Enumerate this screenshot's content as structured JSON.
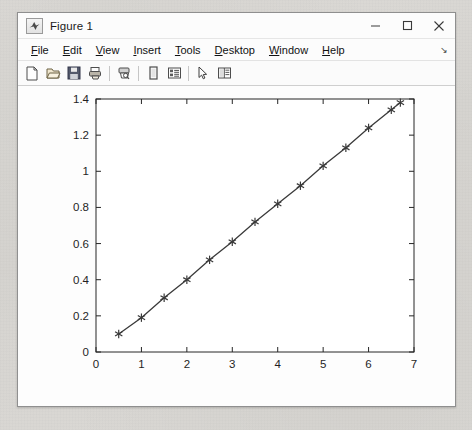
{
  "window": {
    "title": "Figure 1",
    "app_icon": "matlab-icon",
    "controls": [
      {
        "name": "minimize-button",
        "glyph": "minimize-icon"
      },
      {
        "name": "maximize-button",
        "glyph": "maximize-icon"
      },
      {
        "name": "close-button",
        "glyph": "close-icon"
      }
    ]
  },
  "menu": {
    "items": [
      {
        "label": "File",
        "mnemonic": "F"
      },
      {
        "label": "Edit",
        "mnemonic": "E"
      },
      {
        "label": "View",
        "mnemonic": "V"
      },
      {
        "label": "Insert",
        "mnemonic": "I"
      },
      {
        "label": "Tools",
        "mnemonic": "T"
      },
      {
        "label": "Desktop",
        "mnemonic": "D"
      },
      {
        "label": "Window",
        "mnemonic": "W"
      },
      {
        "label": "Help",
        "mnemonic": "H"
      }
    ],
    "overflow_glyph": "↘"
  },
  "toolbar": {
    "buttons": [
      {
        "name": "new-figure-button",
        "icon": "new-document-icon"
      },
      {
        "name": "open-file-button",
        "icon": "open-folder-icon"
      },
      {
        "name": "save-figure-button",
        "icon": "save-disk-icon"
      },
      {
        "name": "print-figure-button",
        "icon": "print-icon"
      },
      {
        "name": "print-preview-button",
        "icon": "print-preview-icon"
      },
      {
        "name": "insert-legend-button",
        "icon": "legend-icon"
      },
      {
        "name": "insert-colorbar-button",
        "icon": "colorbar-icon"
      },
      {
        "name": "edit-plot-button",
        "icon": "pointer-arrow-icon"
      },
      {
        "name": "show-plot-tools-button",
        "icon": "plot-tools-icon"
      }
    ]
  },
  "colors": {
    "window_bg": "#fbfbfb",
    "desktop_bg": "#d8d8d6",
    "axis": "#262626",
    "line": "#3a3a3a",
    "tick_label": "#1f1f1f"
  },
  "chart_data": {
    "type": "line",
    "title": "",
    "xlabel": "",
    "ylabel": "",
    "marker": "asterisk",
    "linestyle": "solid",
    "grid": false,
    "legend": null,
    "xlim": [
      0,
      7
    ],
    "ylim": [
      0,
      1.4
    ],
    "xticks": [
      0,
      1,
      2,
      3,
      4,
      5,
      6,
      7
    ],
    "xticklabels": [
      "0",
      "1",
      "2",
      "3",
      "4",
      "5",
      "6",
      "7"
    ],
    "yticks": [
      0,
      0.2,
      0.4,
      0.6,
      0.8,
      1,
      1.2,
      1.4
    ],
    "yticklabels": [
      "0",
      "0.2",
      "0.4",
      "0.6",
      "0.8",
      "1",
      "1.2",
      "1.4"
    ],
    "x": [
      0.5,
      1.0,
      1.5,
      2.0,
      2.5,
      3.0,
      3.5,
      4.0,
      4.5,
      5.0,
      5.5,
      6.0,
      6.5,
      6.7
    ],
    "y": [
      0.1,
      0.19,
      0.3,
      0.4,
      0.51,
      0.61,
      0.72,
      0.82,
      0.92,
      1.03,
      1.13,
      1.24,
      1.34,
      1.38
    ]
  }
}
